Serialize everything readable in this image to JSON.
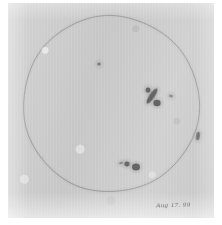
{
  "document": {
    "type": "hand-drawn sunspot observation sketch",
    "medium": "pencil on paper, scanned",
    "paper_color": "#c9c9c9",
    "ink_color": "#3a3a3a",
    "limb_color": "#6e6e6e"
  },
  "annotation": {
    "caption": "Aug 17. 99"
  },
  "chart_data": {
    "type": "scatter",
    "subtitle": "Aug 17. 99",
    "xlabel": "",
    "ylabel": "",
    "grid": false,
    "legend": null,
    "xlim": [
      -1,
      1
    ],
    "ylim": [
      -1,
      1
    ],
    "disk": {
      "label": "solar limb",
      "center_x": 111,
      "center_y": 104,
      "radius": 88,
      "stroke": "#6e6e6e",
      "stroke_width": 0.8
    },
    "series": [
      {
        "name": "sunspot groups",
        "points": [
          {
            "label": "isolated pore, north-central",
            "cx": 99,
            "cy": 64,
            "rx": 1.6,
            "ry": 1.6,
            "angle": 0,
            "opacity": 0.62
          },
          {
            "label": "main group leader streak, northeast",
            "cx": 152,
            "cy": 96,
            "rx": 2.6,
            "ry": 9.0,
            "angle": 34,
            "opacity": 0.92
          },
          {
            "label": "main group trailing umbra",
            "cx": 157,
            "cy": 103,
            "rx": 3.6,
            "ry": 3.2,
            "angle": 0,
            "opacity": 0.95
          },
          {
            "label": "main group northern knot",
            "cx": 148,
            "cy": 90,
            "rx": 2.4,
            "ry": 2.6,
            "angle": 0,
            "opacity": 0.88
          },
          {
            "label": "companion pore east of main group",
            "cx": 171,
            "cy": 96,
            "rx": 2.0,
            "ry": 1.2,
            "angle": 15,
            "opacity": 0.58
          },
          {
            "label": "small spot near east limb",
            "cx": 198,
            "cy": 136,
            "rx": 1.8,
            "ry": 4.2,
            "angle": 8,
            "opacity": 0.8
          },
          {
            "label": "southwest group following umbra",
            "cx": 136,
            "cy": 167,
            "rx": 4.0,
            "ry": 3.6,
            "angle": 0,
            "opacity": 0.93
          },
          {
            "label": "southwest group leading umbra",
            "cx": 127,
            "cy": 164,
            "rx": 2.6,
            "ry": 2.4,
            "angle": 0,
            "opacity": 0.86
          },
          {
            "label": "southwest group faint tail",
            "cx": 121,
            "cy": 163,
            "rx": 2.2,
            "ry": 1.1,
            "angle": -18,
            "opacity": 0.55
          }
        ]
      }
    ]
  }
}
